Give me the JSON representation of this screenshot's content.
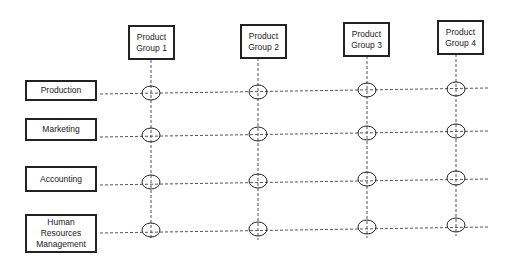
{
  "diagram": {
    "type": "matrix-organization",
    "product_groups": [
      {
        "label": "Product\nGroup 1",
        "line1": "Product",
        "line2": "Group 1",
        "x": 128,
        "y": 25,
        "cx": 151
      },
      {
        "label": "Product\nGroup 2",
        "line1": "Product",
        "line2": "Group 2",
        "x": 240,
        "y": 24,
        "cx": 258
      },
      {
        "label": "Product\nGroup 3",
        "line1": "Product",
        "line2": "Group 3",
        "x": 343,
        "y": 22,
        "cx": 367
      },
      {
        "label": "Product\nGroup 4",
        "line1": "Product",
        "line2": "Group 4",
        "x": 437,
        "y": 20,
        "cx": 456
      }
    ],
    "departments": [
      {
        "line1": "Production",
        "line2": "",
        "y": 80,
        "h": 20,
        "ly": 95
      },
      {
        "line1": "Marketing",
        "line2": "",
        "y": 118,
        "h": 22,
        "ly": 133
      },
      {
        "line1": "Accounting",
        "line2": "",
        "y": 166,
        "h": 26,
        "ly": 182
      },
      {
        "line1": "Human Resources",
        "line2": "Management",
        "y": 214,
        "h": 39,
        "ly": 230
      }
    ],
    "colors": {
      "stroke": "#222222",
      "dash": "#555555",
      "background": "#ffffff"
    }
  }
}
